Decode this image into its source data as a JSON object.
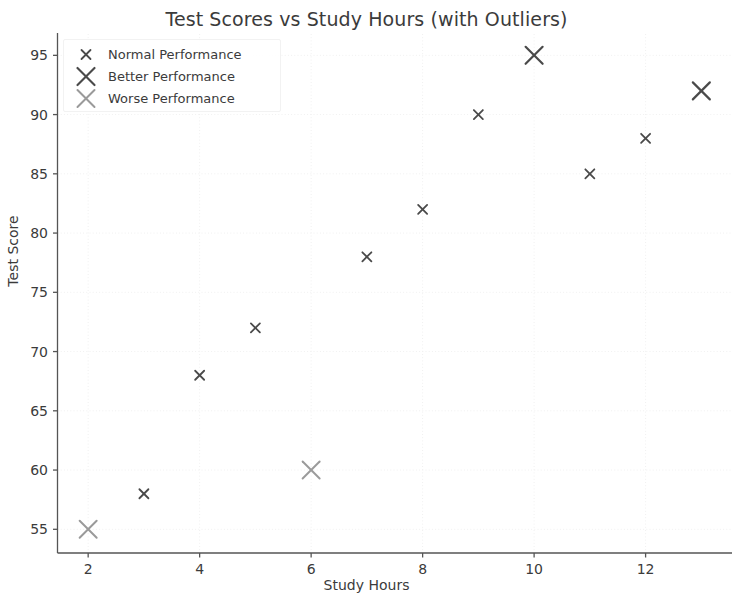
{
  "chart_data": {
    "type": "scatter",
    "title": "Test Scores vs Study Hours (with Outliers)",
    "xlabel": "Study Hours",
    "ylabel": "Test Score",
    "xlim": [
      1.45,
      13.55
    ],
    "ylim": [
      53.0,
      96.8
    ],
    "xticks": [
      2,
      4,
      6,
      8,
      10,
      12
    ],
    "yticks": [
      55,
      60,
      65,
      70,
      75,
      80,
      85,
      90,
      95
    ],
    "grid": true,
    "grid_style": "dotted",
    "grid_color": "#f0f0f0",
    "legend_position": "upper left",
    "background_color": "#ffffff",
    "series": [
      {
        "name": "Normal Performance",
        "marker": "x",
        "marker_size": 9,
        "marker_linewidth": 1.8,
        "color": "#4a4a4a",
        "points": [
          {
            "x": 3,
            "y": 58
          },
          {
            "x": 4,
            "y": 68
          },
          {
            "x": 5,
            "y": 72
          },
          {
            "x": 7,
            "y": 78
          },
          {
            "x": 8,
            "y": 82
          },
          {
            "x": 9,
            "y": 90
          },
          {
            "x": 11,
            "y": 85
          },
          {
            "x": 12,
            "y": 88
          }
        ]
      },
      {
        "name": "Better Performance",
        "marker": "x",
        "marker_size": 17,
        "marker_linewidth": 2.2,
        "color": "#4a4a4a",
        "points": [
          {
            "x": 10,
            "y": 95
          },
          {
            "x": 13,
            "y": 92
          }
        ]
      },
      {
        "name": "Worse Performance",
        "marker": "x",
        "marker_size": 17,
        "marker_linewidth": 2.0,
        "color": "#9a9a9a",
        "points": [
          {
            "x": 2,
            "y": 55
          },
          {
            "x": 6,
            "y": 60
          }
        ]
      }
    ]
  },
  "legend": {
    "entries": [
      {
        "label": "Normal Performance"
      },
      {
        "label": "Better Performance"
      },
      {
        "label": "Worse Performance"
      }
    ]
  },
  "axes": {
    "x_tick_labels": [
      "2",
      "4",
      "6",
      "8",
      "10",
      "12"
    ],
    "y_tick_labels": [
      "55",
      "60",
      "65",
      "70",
      "75",
      "80",
      "85",
      "90",
      "95"
    ]
  }
}
